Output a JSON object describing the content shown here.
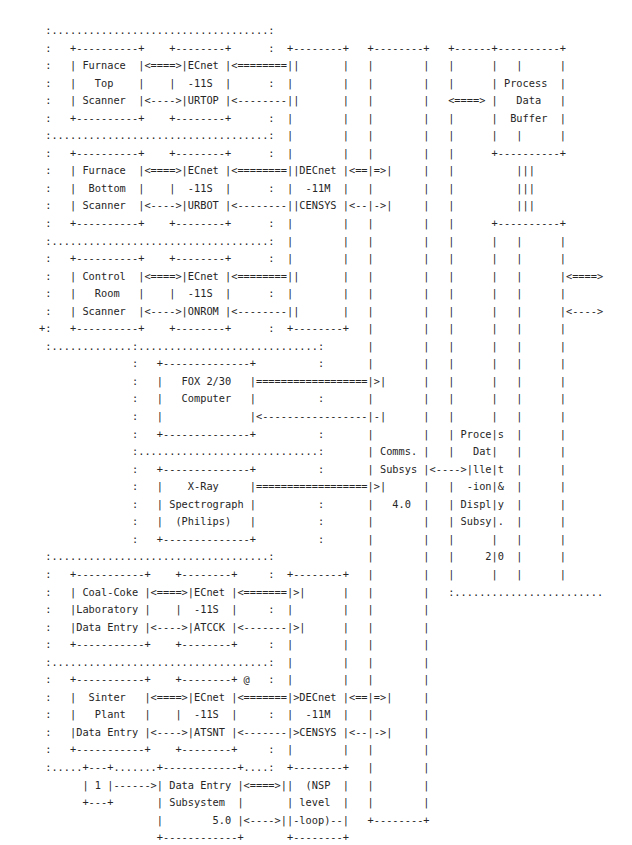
{
  "diagram": {
    "type": "ascii-block-diagram",
    "style": {
      "text_color": "#262626",
      "background_color": "#ffffff",
      "font_size_px": 10.3,
      "line_height_px": 17.55,
      "char_width_px": 6.19
    },
    "legend": {
      "solid_box_border": "+---+ and | : a hardware or software component box",
      "dotted_box_border": ": and . : a subsystem grouping boundary",
      "double_arrow": "<====>  data / message link",
      "single_arrow": "<---->  control link",
      "long_double_arrow": "<========>  long-haul data link",
      "long_single_arrow": "<-------->  long-haul control link"
    },
    "nodes": [
      {
        "id": "furnace-top-scanner",
        "lines": [
          "Furnace",
          "Top",
          "Scanner"
        ],
        "group": "scanner-group"
      },
      {
        "id": "decnet-11s-furtop",
        "lines": [
          "DECnet",
          "-11S",
          "FURTOP"
        ],
        "group": "scanner-group"
      },
      {
        "id": "furnace-bottom-scanner",
        "lines": [
          "Furnace",
          "Bottom",
          "Scanner"
        ],
        "group": "scanner-group"
      },
      {
        "id": "decnet-11s-furbot",
        "lines": [
          "DECnet",
          "-11S",
          "FURBOT"
        ],
        "group": "scanner-group"
      },
      {
        "id": "control-room-scanner",
        "lines": [
          "Control",
          "Room",
          "Scanner"
        ],
        "group": "scanner-group"
      },
      {
        "id": "decnet-11s-conrom",
        "lines": [
          "DECnet",
          "-11S",
          "CONROM"
        ],
        "group": "scanner-group"
      },
      {
        "id": "decnet-11m-censys-top",
        "lines": [
          "DECnet",
          "-11M",
          "CENSYS"
        ],
        "group": "comms"
      },
      {
        "id": "process-data-buffer",
        "lines": [
          "Process",
          "Data",
          "Buffer"
        ],
        "group": "display"
      },
      {
        "id": "fox-230-computer",
        "lines": [
          "FOX 2/30",
          "Computer"
        ],
        "group": "instrument-group"
      },
      {
        "id": "x-ray-spectrograph",
        "lines": [
          "X-Ray",
          "Spectrograph",
          "(Philips)"
        ],
        "group": "instrument-group"
      },
      {
        "id": "comms-subsys",
        "lines": [
          "Comms.",
          "Subsys",
          "",
          "4.0"
        ],
        "group": "comms",
        "number": "4.0"
      },
      {
        "id": "process-data-collection-display-subsys",
        "lines": [
          "Process",
          "Data",
          "Collect",
          "-ion &",
          "Display",
          "Subsys.",
          "",
          "2.0"
        ],
        "group": "display",
        "number": "2.0"
      },
      {
        "id": "coal-coke-laboratory-data-entry",
        "lines": [
          "Coal-Coke",
          "Laboratory",
          "Data Entry"
        ],
        "group": "data-entry-group"
      },
      {
        "id": "decnet-11s-datcck",
        "lines": [
          "DECnet",
          "-11S",
          "DATCCK"
        ],
        "group": "data-entry-group"
      },
      {
        "id": "sinter-plant-data-entry",
        "lines": [
          "Sinter",
          "Plant",
          "Data Entry"
        ],
        "group": "data-entry-group"
      },
      {
        "id": "decnet-11s-datsnt",
        "lines": [
          "DECnet",
          "-11S",
          "DATSNT"
        ],
        "group": "data-entry-group"
      },
      {
        "id": "decnet-11m-censys-bottom",
        "lines": [
          "DECnet",
          "-11M",
          "CENSYS"
        ],
        "group": "comms"
      },
      {
        "id": "nsp-level-loop",
        "lines": [
          "(NSP",
          "level",
          "loop)"
        ],
        "group": "comms"
      },
      {
        "id": "data-entry-subsystem",
        "lines": [
          "Data Entry",
          "Subsystem",
          "5.0"
        ],
        "group": "data-entry",
        "number": "5.0"
      },
      {
        "id": "external-source-1",
        "lines": [
          "1"
        ],
        "group": "external"
      }
    ],
    "annotations": [
      {
        "id": "at-sign-marker",
        "text": "@",
        "near": "decnet-11s-datsnt"
      }
    ],
    "ascii": ":...........................:\n:   +----------+   +--------+    :    +--------+      +--------+    +----------+\n:   | Furnace  |<====>| DECnet |<========>|        |      |        |    | Process  |\n:   |   Top    |   |  -11S  |    :    |        |      |        |<====>|   Data   |\n:   | Scanner  |<---->| FURTOP |<-------->|        |      |        |    |  Buffer  |\n:   +----------+   +--------+    :    |        |      |        |    +----------+"
  },
  "ascii_lines": [
    "   :...........................:",
    "   :                            :",
    "   :   +----------+  +--------+ :      +--------+      +--------+   +----------+",
    "   :   | Furnace  |<====>| DECnet |<========>|        |      |        |   | Process  |",
    "   :   |   Top    |  |  -11S  | :      |        |      |        |   |   Data   |",
    "   :   | Scanner  |<---->| FURTOP |<-------->|        |      |        |   |  Buffer  |",
    "   :   +----------+  +--------+ :      |        |      |        |   +----------+"
  ],
  "grid": {
    "rows": 47,
    "cols": 96
  }
}
